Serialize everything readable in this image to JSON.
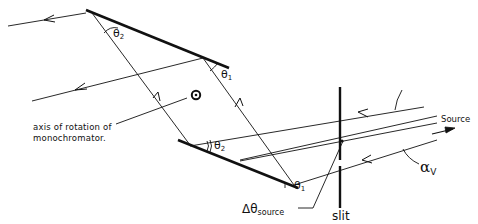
{
  "diagram": {
    "labels": {
      "axis_line1": "axis of rotation of",
      "axis_line2": "monochromator.",
      "theta2_top": "θ",
      "theta2_top_sub": "2",
      "theta1_top": "θ",
      "theta1_top_sub": "1",
      "theta2_bottom": "θ",
      "theta2_bottom_sub": "2",
      "theta1_bottom": "θ",
      "theta1_bottom_sub": "1",
      "source": "Source",
      "slit": "slit",
      "delta_theta": "Δθ",
      "delta_theta_sub": "source",
      "alpha": "α",
      "alpha_sub": "V"
    },
    "elements": [
      "top-crystal",
      "bottom-crystal",
      "slit",
      "axis-of-rotation-marker",
      "incident-beams",
      "diffracted-beams"
    ],
    "colors": {
      "line": "#111111",
      "background": "#ffffff"
    }
  }
}
